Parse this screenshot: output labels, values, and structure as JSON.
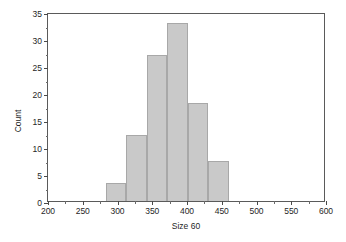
{
  "chart_data": {
    "type": "bar",
    "title": "",
    "subtitle": "",
    "xlabel": "Size 60",
    "ylabel": "Count",
    "xlim": [
      200,
      600
    ],
    "ylim": [
      0,
      35
    ],
    "xticks": [
      200,
      250,
      300,
      350,
      400,
      450,
      500,
      550,
      600
    ],
    "yticks": [
      0,
      5,
      10,
      15,
      20,
      25,
      30,
      35
    ],
    "xtick_labels": [
      "200",
      "250",
      "300",
      "350",
      "400",
      "450",
      "500",
      "550",
      "600"
    ],
    "ytick_labels": [
      "0",
      "5",
      "10",
      "15",
      "20",
      "25",
      "30",
      "35"
    ],
    "grid": false,
    "legend": null,
    "bin_edges": [
      283,
      312.5,
      342,
      371.5,
      401,
      430.5,
      460
    ],
    "categories": [
      "283-312",
      "312-342",
      "342-371",
      "371-401",
      "401-430",
      "430-460"
    ],
    "values": [
      3.3,
      12.3,
      27.0,
      33.0,
      18.2,
      7.5
    ],
    "bar_color": "#c9c9c9",
    "bar_edge_color": "#a8a8a8",
    "axis_color": "#5a5a5a",
    "background": "#ffffff",
    "annotations": []
  }
}
